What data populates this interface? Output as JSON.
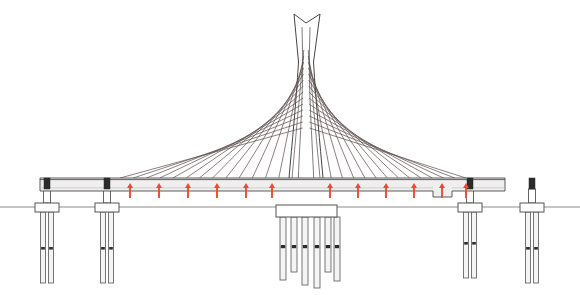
{
  "figure": {
    "kind": "engineering-elevation-drawing",
    "background_color": "#ffffff",
    "canvas": {
      "width": 580,
      "height": 295
    }
  },
  "colors": {
    "outline": "#3a3a3a",
    "cable": "#5a4a4a",
    "deck_fill": "#efefef",
    "deck_edge": "#4a4a4a",
    "deck_top_line": "#7a4038",
    "ground_line": "#8a8a8a",
    "pile_fill": "#f4f4f4",
    "pile_edge": "#555555",
    "bearing": "#2b2b2b",
    "arrow": "#ef4a2a",
    "tower_fill": "#ffffff",
    "tower_edge": "#444444"
  },
  "ground": {
    "y": 207,
    "x_start": 0,
    "x_end": 580,
    "stroke_width": 1
  },
  "deck": {
    "x_left": 40,
    "x_right": 505,
    "y_top": 178,
    "y_bottom": 191,
    "thickness": 13,
    "notch": {
      "x_start": 433,
      "x_end": 452,
      "depth": 6
    }
  },
  "tower": {
    "apex_y": 14,
    "base_y": 178,
    "center_x": 306,
    "top_left_prong_x": 294,
    "top_right_prong_x": 320,
    "neck_y": 62,
    "neck_half_width": 6,
    "base_half_width": 17,
    "notch_depth": 9
  },
  "cables": {
    "count_left": 14,
    "count_right": 14,
    "deck_anchor_left_start": 120,
    "deck_anchor_left_end": 292,
    "deck_anchor_right_start": 320,
    "deck_anchor_right_end": 466,
    "tower_anchor_top_y": 50,
    "tower_anchor_bottom_y": 128,
    "stroke_width": 0.7
  },
  "load_arrows": {
    "label": "upward distributed load arrows",
    "color": "#ef4a2a",
    "count": 12,
    "y_base": 198,
    "y_tip": 183,
    "x_positions": [
      130,
      159,
      188,
      217,
      246,
      272,
      330,
      358,
      386,
      414,
      442,
      466
    ]
  },
  "piers": {
    "approach": [
      {
        "name": "pier-1",
        "x": 47,
        "column_width": 7,
        "cap_width": 24,
        "cap_y": 203,
        "cap_h": 9,
        "pile_bottom": 283,
        "pile_count": 2
      },
      {
        "name": "pier-2",
        "x": 107,
        "column_width": 7,
        "cap_width": 24,
        "cap_y": 203,
        "cap_h": 9,
        "pile_bottom": 283,
        "pile_count": 2
      },
      {
        "name": "pier-3",
        "x": 470,
        "column_width": 7,
        "cap_width": 24,
        "cap_y": 203,
        "cap_h": 9,
        "pile_bottom": 278,
        "pile_count": 2
      },
      {
        "name": "pier-4",
        "x": 532,
        "column_width": 7,
        "cap_width": 24,
        "cap_y": 203,
        "cap_h": 9,
        "pile_bottom": 283,
        "pile_count": 2
      }
    ],
    "main": {
      "name": "main-pier",
      "center_x": 306,
      "cap_x_left": 276,
      "cap_x_right": 337,
      "cap_y": 205,
      "cap_height": 12,
      "pile_count": 6,
      "pile_width": 6,
      "pile_x_positions": [
        280,
        291,
        302,
        314,
        325,
        334
      ],
      "pile_bottoms": [
        280,
        272,
        285,
        288,
        272,
        281
      ],
      "pile_mark_y": 245
    }
  },
  "bearings": [
    {
      "name": "bearing-left-end",
      "x": 47,
      "y": 178,
      "w": 6,
      "h": 11
    },
    {
      "name": "bearing-pier-2",
      "x": 107,
      "y": 178,
      "w": 6,
      "h": 11
    },
    {
      "name": "bearing-pier-3",
      "x": 470,
      "y": 178,
      "w": 6,
      "h": 11
    },
    {
      "name": "bearing-pier-4",
      "x": 532,
      "y": 178,
      "w": 6,
      "h": 11
    }
  ]
}
